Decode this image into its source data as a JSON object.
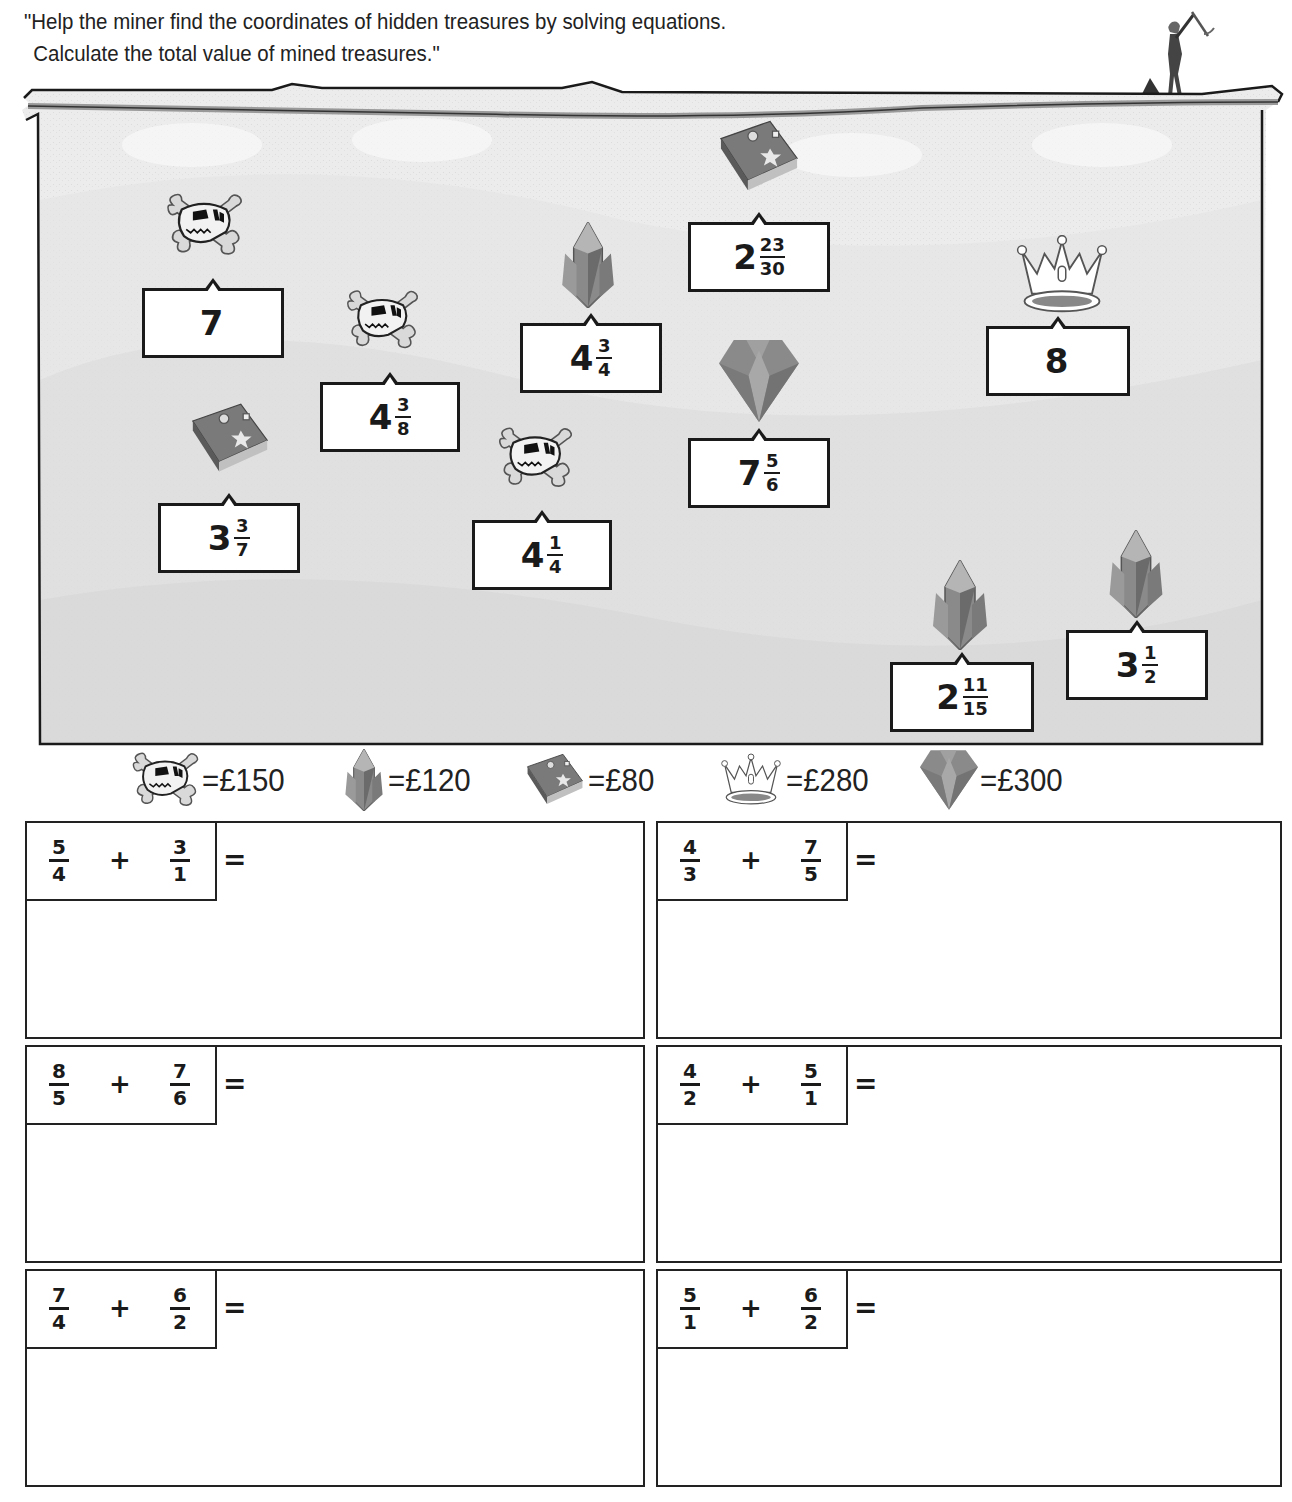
{
  "instructions": {
    "line1": "\"Help the miner find the coordinates of hidden treasures by solving equations.",
    "line2": "Calculate the total value of mined treasures.\""
  },
  "treasures": [
    {
      "icon": "skull-icon",
      "whole": "7",
      "num": "",
      "den": ""
    },
    {
      "icon": "skull-icon",
      "whole": "4",
      "num": "3",
      "den": "8"
    },
    {
      "icon": "crystal-icon",
      "whole": "4",
      "num": "3",
      "den": "4"
    },
    {
      "icon": "book-icon",
      "whole": "2",
      "num": "23",
      "den": "30"
    },
    {
      "icon": "crown-icon",
      "whole": "8",
      "num": "",
      "den": ""
    },
    {
      "icon": "book-icon",
      "whole": "3",
      "num": "3",
      "den": "7"
    },
    {
      "icon": "skull-icon",
      "whole": "4",
      "num": "1",
      "den": "4"
    },
    {
      "icon": "diamond-icon",
      "whole": "7",
      "num": "5",
      "den": "6"
    },
    {
      "icon": "crystal-icon",
      "whole": "2",
      "num": "11",
      "den": "15"
    },
    {
      "icon": "crystal-icon",
      "whole": "3",
      "num": "1",
      "den": "2"
    }
  ],
  "legend": [
    {
      "icon": "skull-icon",
      "value": "=£150"
    },
    {
      "icon": "crystal-icon",
      "value": "=£120"
    },
    {
      "icon": "book-icon",
      "value": "=£80"
    },
    {
      "icon": "crown-icon",
      "value": "=£280"
    },
    {
      "icon": "diamond-icon",
      "value": "=£300"
    }
  ],
  "problems": [
    {
      "a_num": "5",
      "a_den": "4",
      "op": "+",
      "b_num": "3",
      "b_den": "1",
      "eq": "="
    },
    {
      "a_num": "4",
      "a_den": "3",
      "op": "+",
      "b_num": "7",
      "b_den": "5",
      "eq": "="
    },
    {
      "a_num": "8",
      "a_den": "5",
      "op": "+",
      "b_num": "7",
      "b_den": "6",
      "eq": "="
    },
    {
      "a_num": "4",
      "a_den": "2",
      "op": "+",
      "b_num": "5",
      "b_den": "1",
      "eq": "="
    },
    {
      "a_num": "7",
      "a_den": "4",
      "op": "+",
      "b_num": "6",
      "b_den": "2",
      "eq": "="
    },
    {
      "a_num": "5",
      "a_den": "1",
      "op": "+",
      "b_num": "6",
      "b_den": "2",
      "eq": "="
    }
  ],
  "colors": {
    "ground": "#ececec",
    "outline": "#1a1a1a",
    "book": "#6a6a6a",
    "crystal": "#7a7a7a",
    "diamond": "#8c8c8c"
  }
}
